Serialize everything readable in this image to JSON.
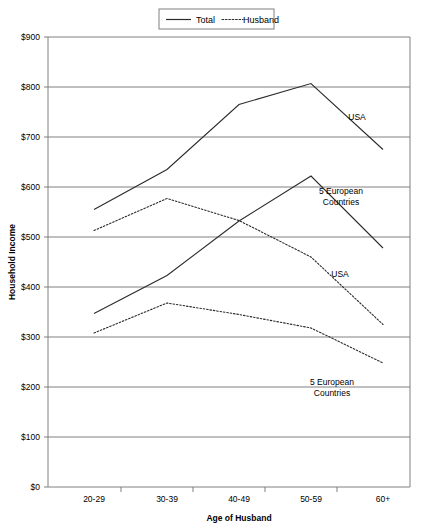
{
  "chart_data": {
    "type": "line",
    "title": "",
    "xlabel": "Age of Husband",
    "ylabel": "Household Income",
    "categories": [
      "20-29",
      "30-39",
      "40-49",
      "50-59",
      "60+"
    ],
    "ylim": [
      0,
      900
    ],
    "ytick_step": 100,
    "ytick_labels": [
      "$0",
      "$100",
      "$200",
      "$300",
      "$400",
      "$500",
      "$600",
      "$700",
      "$800",
      "$900"
    ],
    "ytick_values": [
      0,
      100,
      200,
      300,
      400,
      500,
      600,
      700,
      800,
      900
    ],
    "grid": "horizontal",
    "legend_position": "top-center",
    "legend": [
      {
        "label": "Total",
        "style": "solid"
      },
      {
        "label": "Husband",
        "style": "dotted"
      }
    ],
    "series": [
      {
        "name": "USA Total",
        "group": "USA",
        "measure": "Total",
        "style": "solid",
        "values": [
          555,
          635,
          765,
          807,
          675
        ]
      },
      {
        "name": "USA Husband",
        "group": "USA",
        "measure": "Husband",
        "style": "dotted",
        "values": [
          513,
          577,
          533,
          460,
          325
        ]
      },
      {
        "name": "5 European Countries Total",
        "group": "5 European Countries",
        "measure": "Total",
        "style": "solid",
        "values": [
          347,
          423,
          532,
          622,
          478
        ]
      },
      {
        "name": "5 European Countries Husband",
        "group": "5 European Countries",
        "measure": "Husband",
        "style": "dotted",
        "values": [
          308,
          368,
          345,
          318,
          248
        ]
      }
    ],
    "annotations": [
      {
        "id": "usa-total",
        "text": "USA",
        "lines": [
          "USA"
        ],
        "x": 357,
        "y": 120
      },
      {
        "id": "europe-total",
        "text": "5 European Countries",
        "lines": [
          "5 European",
          "Countries"
        ],
        "x": 341,
        "y": 194
      },
      {
        "id": "usa-husband",
        "text": "USA",
        "lines": [
          "USA"
        ],
        "x": 340,
        "y": 277
      },
      {
        "id": "europe-husband",
        "text": "5 European Countries",
        "lines": [
          "5 European",
          "Countries"
        ],
        "x": 332,
        "y": 385
      }
    ]
  }
}
